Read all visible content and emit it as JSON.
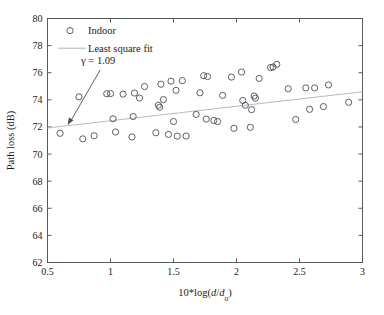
{
  "chart_data": {
    "type": "scatter",
    "title": "",
    "xlabel": "10*log(d/d₀)",
    "xlabel_parts": {
      "prefix": "10*log(",
      "var1": "d",
      "slash": "/",
      "var2": "d",
      "sub": "o",
      "suffix": ")"
    },
    "ylabel": "Path loss (dB)",
    "xlim": [
      0.5,
      3
    ],
    "ylim": [
      62,
      80
    ],
    "xticks": [
      "0.5",
      "1",
      "1.5",
      "2",
      "2.5",
      "3"
    ],
    "xtick_values": [
      0.5,
      1,
      1.5,
      2,
      2.5,
      3
    ],
    "yticks": [
      "62",
      "64",
      "66",
      "68",
      "70",
      "72",
      "74",
      "76",
      "78",
      "80"
    ],
    "ytick_values": [
      62,
      64,
      66,
      68,
      70,
      72,
      74,
      76,
      78,
      80
    ],
    "grid": false,
    "legend_position": "top-left",
    "legend": [
      {
        "label": "Indoor",
        "marker": "circle",
        "type": "scatter"
      },
      {
        "label": "Least square fit",
        "marker": "line",
        "type": "line"
      }
    ],
    "annotations": [
      {
        "text": "γ = 1.09",
        "text_parts": {
          "symbol": "γ",
          "equals": " = ",
          "value": "1.09"
        },
        "x": 0.95,
        "y": 76.35,
        "arrow_to_x": 0.66,
        "arrow_to_y": 72.15
      }
    ],
    "series": [
      {
        "name": "Indoor",
        "marker": "circle",
        "color": "#4a4f55",
        "points": [
          [
            0.6,
            71.53
          ],
          [
            0.75,
            74.22
          ],
          [
            0.78,
            71.12
          ],
          [
            0.87,
            71.35
          ],
          [
            0.97,
            74.45
          ],
          [
            1.0,
            74.46
          ],
          [
            1.02,
            72.6
          ],
          [
            1.04,
            71.63
          ],
          [
            1.1,
            74.42
          ],
          [
            1.17,
            71.26
          ],
          [
            1.18,
            72.77
          ],
          [
            1.19,
            74.5
          ],
          [
            1.23,
            74.13
          ],
          [
            1.27,
            74.98
          ],
          [
            1.36,
            71.57
          ],
          [
            1.38,
            73.6
          ],
          [
            1.39,
            73.45
          ],
          [
            1.4,
            75.15
          ],
          [
            1.42,
            74.02
          ],
          [
            1.46,
            71.45
          ],
          [
            1.48,
            75.38
          ],
          [
            1.5,
            72.4
          ],
          [
            1.52,
            74.7
          ],
          [
            1.53,
            71.32
          ],
          [
            1.57,
            75.42
          ],
          [
            1.6,
            71.33
          ],
          [
            1.68,
            72.92
          ],
          [
            1.71,
            74.52
          ],
          [
            1.74,
            75.78
          ],
          [
            1.76,
            72.58
          ],
          [
            1.77,
            75.72
          ],
          [
            1.82,
            72.48
          ],
          [
            1.85,
            72.4
          ],
          [
            1.89,
            74.33
          ],
          [
            1.96,
            75.68
          ],
          [
            1.98,
            71.9
          ],
          [
            2.04,
            76.05
          ],
          [
            2.05,
            73.95
          ],
          [
            2.07,
            73.6
          ],
          [
            2.11,
            71.97
          ],
          [
            2.12,
            73.28
          ],
          [
            2.14,
            74.28
          ],
          [
            2.15,
            74.12
          ],
          [
            2.18,
            75.58
          ],
          [
            2.27,
            76.38
          ],
          [
            2.29,
            76.42
          ],
          [
            2.32,
            76.62
          ],
          [
            2.41,
            74.82
          ],
          [
            2.47,
            72.55
          ],
          [
            2.55,
            74.88
          ],
          [
            2.58,
            73.3
          ],
          [
            2.62,
            74.88
          ],
          [
            2.69,
            73.5
          ],
          [
            2.73,
            75.1
          ],
          [
            2.89,
            73.82
          ]
        ]
      },
      {
        "name": "Least square fit",
        "type": "line",
        "color": "#b9bcc0",
        "endpoints": [
          [
            0.5,
            71.92
          ],
          [
            3.0,
            74.6
          ]
        ],
        "slope": 1.072,
        "gamma": 1.09
      }
    ]
  }
}
